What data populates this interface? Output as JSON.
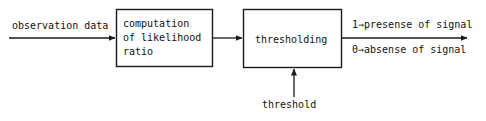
{
  "diagram": {
    "background_color": "#ffffff",
    "line_color": "#1a1a1a",
    "text_color": "#111111",
    "blocks": [
      {
        "id": "likelihood-ratio",
        "label": "computation\nof likelihood\nratio",
        "x": 116,
        "y": 9,
        "width": 97,
        "height": 58
      },
      {
        "id": "thresholding",
        "label": "thresholding",
        "x": 243,
        "y": 9,
        "width": 99,
        "height": 59
      }
    ],
    "labels": {
      "input": "observation data",
      "threshold": "threshold",
      "output_presence": "1⇒presense of signal",
      "output_absence": "0⇒absense of signal"
    },
    "arrows": [
      {
        "id": "input-arrow",
        "from": "observation data",
        "to": "likelihood-ratio",
        "direction": "right"
      },
      {
        "id": "interstage-arrow",
        "from": "likelihood-ratio",
        "to": "thresholding",
        "direction": "right"
      },
      {
        "id": "threshold-arrow",
        "from": "threshold",
        "to": "thresholding",
        "direction": "up"
      },
      {
        "id": "output-arrow",
        "from": "thresholding",
        "to": "output",
        "direction": "right"
      }
    ]
  }
}
